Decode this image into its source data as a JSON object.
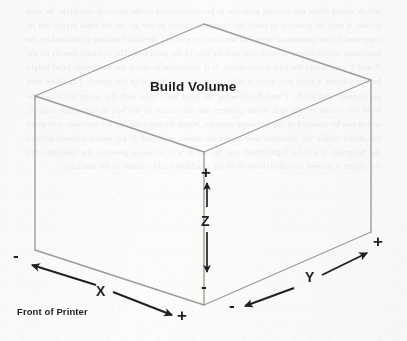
{
  "figure": {
    "title": "Build Volume",
    "front_label": "Front of Printer",
    "background_bleed_text": "which would allow the moving platform to be repositioned so the object is complete. In such a case, it may be possible to build the complete object in one go, so the final layers can be supported by the previous layers. For most of the printers, the build volume is defined by the maximum displacement of each axis and the size of the print bed. The extruder travels on the X and Y axes while the bed moves down. It is important to check the maximum print height before starting a print job, since a taller object may collide with the gantry. The three axes are usually labelled X, Y and Z following the right hand rule, with the origin placed at the front left corner of the bed. Some printers use the centre of the bed as the origin instead, which can be changed in the firmware settings. When slicing a model, the software will place the object within the printable area shown on screen as a grid. If the model extends beyond the boundary it will be highlighted, and the slicer will refuse to generate the toolpath until the object is moved or scaled down to fit the available build volume of the machine."
  },
  "colors": {
    "cube_line": "#9b9b99",
    "arrow": "#231f20",
    "text": "#231f20",
    "background": "#fbfbfa"
  },
  "cube": {
    "label": "Build Volume",
    "vertices": {
      "top_back": [
        204,
        24
      ],
      "top_left": [
        35,
        96
      ],
      "top_right": [
        371,
        80
      ],
      "top_front": [
        204,
        152
      ],
      "bottom_left": [
        35,
        250
      ],
      "bottom_right": [
        371,
        232
      ],
      "bottom_front": [
        204,
        305
      ]
    }
  },
  "axes": [
    {
      "name": "Z",
      "label": "Z",
      "label_pos": [
        201,
        213
      ],
      "plus": {
        "sign": "+",
        "pos": [
          201,
          164
        ]
      },
      "minus": {
        "sign": "-",
        "pos": [
          201,
          278
        ]
      },
      "arrow_positive": {
        "from": [
          207,
          207
        ],
        "to": [
          207,
          182
        ],
        "direction": "up"
      },
      "arrow_negative": {
        "from": [
          207,
          232
        ],
        "to": [
          207,
          275
        ],
        "direction": "down"
      }
    },
    {
      "name": "X",
      "label": "X",
      "label_pos": [
        96,
        283
      ],
      "plus": {
        "sign": "+",
        "pos": [
          177,
          307
        ]
      },
      "minus": {
        "sign": "-",
        "pos": [
          13,
          247
        ]
      },
      "arrow_positive": {
        "from": [
          113,
          292
        ],
        "to": [
          174,
          316
        ],
        "direction": "down-right"
      },
      "arrow_negative": {
        "from": [
          94,
          284
        ],
        "to": [
          30,
          264
        ],
        "direction": "up-left"
      }
    },
    {
      "name": "Y",
      "label": "Y",
      "label_pos": [
        305,
        269
      ],
      "plus": {
        "sign": "+",
        "pos": [
          373,
          233
        ]
      },
      "minus": {
        "sign": "-",
        "pos": [
          229,
          297
        ]
      },
      "arrow_positive": {
        "from": [
          322,
          274
        ],
        "to": [
          369,
          252
        ],
        "direction": "up-right"
      },
      "arrow_negative": {
        "from": [
          294,
          288
        ],
        "to": [
          243,
          307
        ],
        "direction": "down-left"
      }
    }
  ],
  "axis_labels": {
    "z": "Z",
    "x": "X",
    "y": "Y"
  },
  "signs": {
    "plus": "+",
    "minus": "-"
  }
}
